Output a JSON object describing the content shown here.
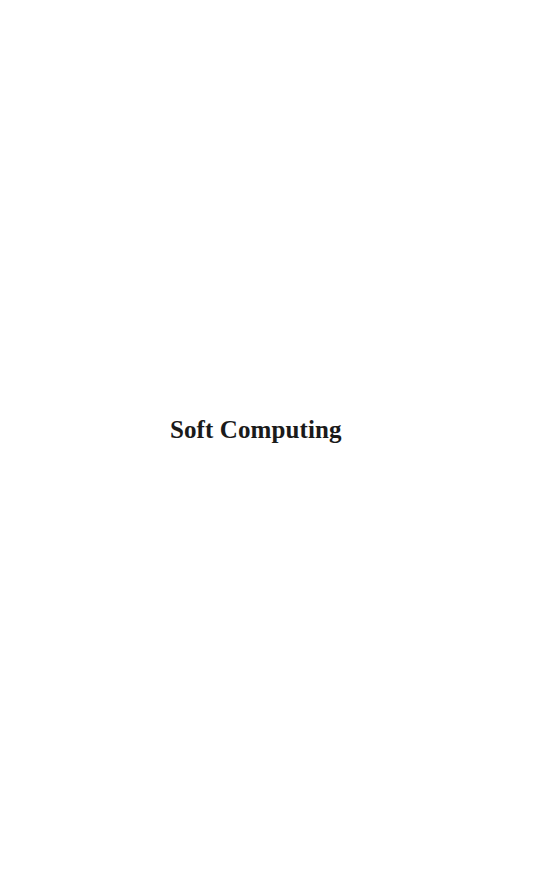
{
  "page": {
    "title": "Soft Computing"
  }
}
